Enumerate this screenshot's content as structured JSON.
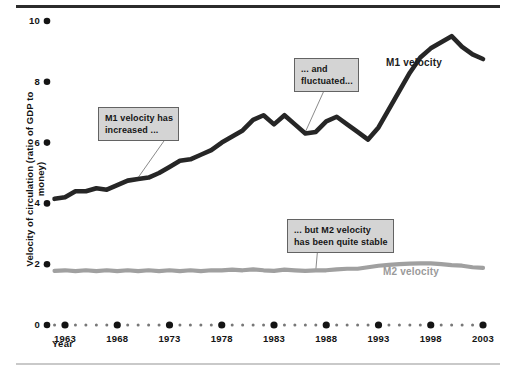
{
  "chart_data": {
    "type": "line",
    "title": "",
    "xlabel": "Year",
    "ylabel": "Velocity of circulation (ratio of GDP to money)",
    "xlim": [
      1962,
      2004
    ],
    "ylim": [
      0,
      10
    ],
    "yticks": [
      0,
      2,
      4,
      6,
      8,
      10
    ],
    "ytick_labels": [
      "0",
      "2",
      "4",
      "6",
      "8",
      "10"
    ],
    "xticks": [
      1963,
      1968,
      1973,
      1978,
      1983,
      1988,
      1993,
      1998,
      2003
    ],
    "xtick_labels": [
      "1963",
      "1968",
      "1973",
      "1978",
      "1983",
      "1988",
      "1993",
      "1998",
      "2003"
    ],
    "grid": false,
    "legend_position": "inline-series-labels",
    "x": [
      1962,
      1963,
      1964,
      1965,
      1966,
      1967,
      1968,
      1969,
      1970,
      1971,
      1972,
      1973,
      1974,
      1975,
      1976,
      1977,
      1978,
      1979,
      1980,
      1981,
      1982,
      1983,
      1984,
      1985,
      1986,
      1987,
      1988,
      1989,
      1990,
      1991,
      1992,
      1993,
      1994,
      1995,
      1996,
      1997,
      1998,
      1999,
      2000,
      2001,
      2002,
      2003
    ],
    "series": [
      {
        "name": "M1 velocity",
        "color": "#262626",
        "values": [
          4.15,
          4.2,
          4.4,
          4.4,
          4.5,
          4.45,
          4.6,
          4.75,
          4.8,
          4.85,
          5.0,
          5.2,
          5.4,
          5.45,
          5.6,
          5.75,
          6.0,
          6.2,
          6.4,
          6.75,
          6.9,
          6.6,
          6.9,
          6.6,
          6.3,
          6.35,
          6.7,
          6.85,
          6.6,
          6.35,
          6.1,
          6.5,
          7.1,
          7.7,
          8.3,
          8.8,
          9.1,
          9.3,
          9.5,
          9.15,
          8.9,
          8.75
        ]
      },
      {
        "name": "M2 velocity",
        "color": "#a0a0a0",
        "values": [
          1.78,
          1.8,
          1.77,
          1.8,
          1.77,
          1.8,
          1.77,
          1.8,
          1.77,
          1.8,
          1.77,
          1.8,
          1.77,
          1.8,
          1.77,
          1.8,
          1.8,
          1.82,
          1.8,
          1.83,
          1.8,
          1.78,
          1.82,
          1.8,
          1.78,
          1.8,
          1.8,
          1.83,
          1.85,
          1.85,
          1.9,
          1.95,
          1.98,
          2.0,
          2.02,
          2.03,
          2.03,
          2.0,
          1.97,
          1.95,
          1.9,
          1.88
        ]
      }
    ],
    "annotations": [
      {
        "id": "m1-increased",
        "text": "M1 velocity has\nincreased ...",
        "leader_from_x": 1970,
        "leader_from_y": 4.85
      },
      {
        "id": "m1-fluctuated",
        "text": "... and\nfluctuated...",
        "leader_from_x": 1986,
        "leader_from_y": 6.35
      },
      {
        "id": "m2-stable",
        "text": "... but M2 velocity\nhas been quite stable",
        "leader_from_x": 1987,
        "leader_from_y": 1.8
      }
    ],
    "series_labels": [
      {
        "name": "M1 velocity",
        "color": "#1c1c1c"
      },
      {
        "name": "M2 velocity",
        "color": "#9a9a9a"
      }
    ]
  },
  "axes": {
    "y_title": "Velocity of circulation (ratio of GDP to money)",
    "x_title": "Year",
    "y_labels": [
      "10",
      "8",
      "6",
      "4",
      "2",
      "0"
    ],
    "x_labels": [
      "1963",
      "1968",
      "1973",
      "1978",
      "1983",
      "1988",
      "1993",
      "1998",
      "2003"
    ]
  },
  "callouts": {
    "one": "M1 velocity has\nincreased ...",
    "two": "... and\nfluctuated...",
    "three": "... but M2 velocity\nhas been quite stable"
  },
  "labels": {
    "m1": "M1 velocity",
    "m2": "M2 velocity"
  },
  "colors": {
    "m1_line": "#262626",
    "m2_line": "#a0a0a0",
    "axis_dots": "#141414",
    "callout_bg": "#d4d4d4",
    "callout_border": "#636363",
    "rule_top": "#2b2b2b",
    "rule_bottom": "#c9c9c9"
  }
}
